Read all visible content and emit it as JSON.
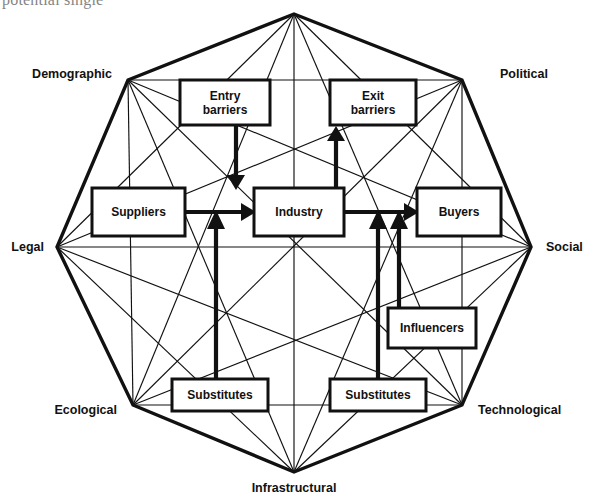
{
  "page": {
    "clipped_text_top": "potential single",
    "background_color": "#ffffff",
    "ink_color": "#111111"
  },
  "diagram": {
    "type": "decagon-environment-model",
    "title": "",
    "outer_vertex_labels": [
      {
        "id": "top",
        "label": "",
        "x": 294,
        "y": 14,
        "label_x": 294,
        "label_y": 8,
        "anchor": "middle",
        "visible": false
      },
      {
        "id": "political",
        "label": "Political",
        "x": 462,
        "y": 80,
        "label_x": 500,
        "label_y": 78,
        "anchor": "start",
        "visible": true
      },
      {
        "id": "social",
        "label": "Social",
        "x": 531,
        "y": 247,
        "label_x": 546,
        "label_y": 251,
        "anchor": "start",
        "visible": true
      },
      {
        "id": "technological",
        "label": "Technological",
        "x": 462,
        "y": 405,
        "label_x": 478,
        "label_y": 414,
        "anchor": "start",
        "visible": true
      },
      {
        "id": "infrastructural",
        "label": "Infrastructural",
        "x": 294,
        "y": 472,
        "label_x": 294,
        "label_y": 492,
        "anchor": "middle",
        "visible": true
      },
      {
        "id": "ecological",
        "label": "Ecological",
        "x": 133,
        "y": 405,
        "label_x": 117,
        "label_y": 414,
        "anchor": "end",
        "visible": true
      },
      {
        "id": "legal",
        "label": "Legal",
        "x": 57,
        "y": 247,
        "label_x": 44,
        "label_y": 251,
        "anchor": "end",
        "visible": true
      },
      {
        "id": "demographic",
        "label": "Demographic",
        "x": 128,
        "y": 80,
        "label_x": 112,
        "label_y": 78,
        "anchor": "end",
        "visible": true
      }
    ],
    "inner_boxes": [
      {
        "id": "entry-barriers",
        "label": "Entry barriers",
        "line1": "Entry",
        "line2": "barriers",
        "x": 180,
        "y": 80,
        "w": 90,
        "h": 45
      },
      {
        "id": "exit-barriers",
        "label": "Exit barriers",
        "line1": "Exit",
        "line2": "barriers",
        "x": 330,
        "y": 80,
        "w": 86,
        "h": 45
      },
      {
        "id": "suppliers",
        "label": "Suppliers",
        "line1": "Suppliers",
        "line2": "",
        "x": 92,
        "y": 188,
        "w": 93,
        "h": 48
      },
      {
        "id": "industry",
        "label": "Industry",
        "line1": "Industry",
        "line2": "",
        "x": 254,
        "y": 188,
        "w": 90,
        "h": 48
      },
      {
        "id": "buyers",
        "label": "Buyers",
        "line1": "Buyers",
        "line2": "",
        "x": 417,
        "y": 188,
        "w": 84,
        "h": 48
      },
      {
        "id": "influencers",
        "label": "Influencers",
        "line1": "Influencers",
        "line2": "",
        "x": 388,
        "y": 308,
        "w": 88,
        "h": 40
      },
      {
        "id": "substitutes-left",
        "label": "Substitutes",
        "line1": "Substitutes",
        "line2": "",
        "x": 172,
        "y": 379,
        "w": 96,
        "h": 32
      },
      {
        "id": "substitutes-right",
        "label": "Substitutes",
        "line1": "Substitutes",
        "line2": "",
        "x": 330,
        "y": 379,
        "w": 96,
        "h": 32
      }
    ],
    "flow_arrows": [
      {
        "id": "suppliers-to-industry",
        "from": "suppliers",
        "to": "industry",
        "direction": "right"
      },
      {
        "id": "industry-to-buyers",
        "from": "industry",
        "to": "buyers",
        "direction": "right"
      },
      {
        "id": "entry-barriers-to-industry",
        "from": "entry-barriers",
        "to": "industry",
        "direction": "down"
      },
      {
        "id": "industry-to-exit-barriers",
        "from": "industry",
        "to": "exit-barriers",
        "direction": "up"
      },
      {
        "id": "substitutes-left-to-industry",
        "from": "substitutes-left",
        "to": "industry",
        "direction": "up"
      },
      {
        "id": "substitutes-right-to-buyers",
        "from": "substitutes-right",
        "to": "buyers",
        "direction": "up"
      },
      {
        "id": "influencers-to-buyers",
        "from": "influencers",
        "to": "buyers",
        "direction": "up"
      }
    ]
  }
}
